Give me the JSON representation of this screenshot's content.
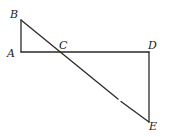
{
  "diagram": {
    "type": "geometry",
    "points": {
      "A": {
        "x": 21,
        "y": 52
      },
      "B": {
        "x": 21,
        "y": 20
      },
      "C": {
        "x": 59,
        "y": 52
      },
      "D": {
        "x": 149,
        "y": 52
      },
      "E": {
        "x": 149,
        "y": 122
      }
    },
    "labels": {
      "A": "A",
      "B": "B",
      "C": "C",
      "D": "D",
      "E": "E"
    },
    "segments": [
      "AB",
      "AD",
      "BE",
      "DE"
    ],
    "colors": {
      "stroke": "#2a2a2a",
      "label": "#1a1a1a",
      "background": "#ffffff"
    }
  }
}
